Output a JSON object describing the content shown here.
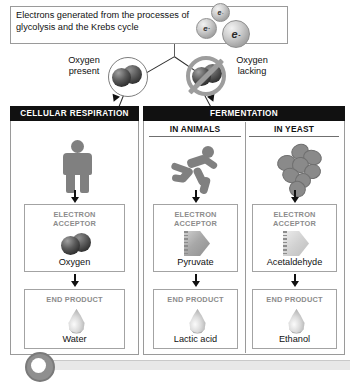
{
  "intro": {
    "text": "Electrons generated from the processes of glycolysis and the Krebs cycle",
    "electrons": [
      {
        "label": "e",
        "charge": "-"
      },
      {
        "label": "e",
        "charge": "-"
      },
      {
        "label": "e",
        "charge": "-"
      }
    ]
  },
  "branches": {
    "oxygen_present": "Oxygen\npresent",
    "oxygen_present_line1": "Oxygen",
    "oxygen_present_line2": "present",
    "oxygen_lacking_line1": "Oxygen",
    "oxygen_lacking_line2": "lacking"
  },
  "panels": {
    "cellular_respiration": {
      "header": "CELLULAR RESPIRATION",
      "organism_icon": "standing-person-icon",
      "acceptor": {
        "title_line1": "ELECTRON",
        "title_line2": "ACCEPTOR",
        "name": "Oxygen",
        "icon": "oxygen-molecule-icon"
      },
      "product": {
        "title": "END PRODUCT",
        "name": "Water",
        "icon": "droplet-icon"
      }
    },
    "fermentation": {
      "header": "FERMENTATION",
      "columns": [
        {
          "subheader": "IN ANIMALS",
          "organism_icon": "running-person-icon",
          "acceptor": {
            "title_line1": "ELECTRON",
            "title_line2": "ACCEPTOR",
            "name": "Pyruvate",
            "icon": "pyruvate-shape-icon"
          },
          "product": {
            "title": "END PRODUCT",
            "name": "Lactic acid",
            "icon": "droplet-icon"
          }
        },
        {
          "subheader": "IN YEAST",
          "organism_icon": "yeast-cluster-icon",
          "acceptor": {
            "title_line1": "ELECTRON",
            "title_line2": "ACCEPTOR",
            "name": "Acetaldehyde",
            "icon": "acetaldehyde-shape-icon"
          },
          "product": {
            "title": "END PRODUCT",
            "name": "Ethanol",
            "icon": "droplet-icon"
          }
        }
      ]
    }
  },
  "colors": {
    "header_bg": "#111111",
    "header_text": "#ffffff",
    "box_border": "#a3a3a3",
    "label_gray": "#8c8c8c",
    "icon_gray": "#808080"
  }
}
